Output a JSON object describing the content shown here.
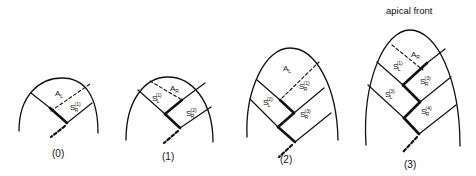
{
  "title": "apical front",
  "panels": [
    {
      "caption": "(0)",
      "labels": {
        "a": "A",
        "a_sub": "L",
        "s1": "S",
        "s1_sub": "R",
        "s1_sup": "(1)"
      }
    },
    {
      "caption": "(1)",
      "labels": {
        "a": "A",
        "a_sub": "R",
        "sl1": "S",
        "sl1_sub": "L",
        "sl1_sup": "(1)",
        "sr2": "S",
        "sr2_sub": "R",
        "sr2_sup": "(2)"
      }
    },
    {
      "caption": "(2)",
      "labels": {
        "a": "A",
        "a_sub": "L",
        "sr1": "S",
        "sr1_sub": "R",
        "sr1_sup": "(1)",
        "sl2": "S",
        "sl2_sub": "L",
        "sl2_sup": "(2)",
        "sr3": "S",
        "sr3_sub": "R",
        "sr3_sup": "(3)"
      }
    },
    {
      "caption": "(3)",
      "labels": {
        "a": "A",
        "a_sub": "R",
        "sl1": "S",
        "sl1_sub": "L",
        "sl1_sup": "(1)",
        "sr3": "S",
        "sr3_sub": "R",
        "sr3_sup": "(3)",
        "sl3": "S",
        "sl3_sub": "L",
        "sl3_sup": "(3)",
        "sr4": "S",
        "sr4_sub": "R",
        "sr4_sup": "(4)"
      }
    }
  ]
}
